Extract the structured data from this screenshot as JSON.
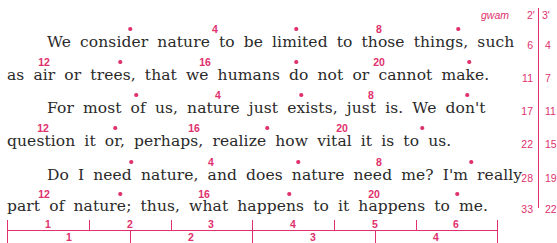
{
  "header": {
    "gwam_label": "gwam",
    "col2_label": "2'",
    "col3_label": "3'"
  },
  "paragraphs": [
    {
      "lines": [
        "We consider nature to be limited to those things, such",
        "as air or trees, that we humans do not or cannot make."
      ]
    },
    {
      "lines": [
        "For most of us, nature just exists, just is. We don't",
        "question it or, perhaps, realize how vital it is to us."
      ]
    },
    {
      "lines": [
        "Do I need nature, and does nature need me? I'm really",
        "part of nature; thus, what happens to it happens to me."
      ]
    }
  ],
  "lines": [
    {
      "text": "We consider nature to be limited to those things, such",
      "gwam2": "6",
      "gwam3": "4"
    },
    {
      "text": "as air or trees, that we humans do not or cannot make.",
      "gwam2": "11",
      "gwam3": "7"
    },
    {
      "text": "For most of us, nature just exists, just is. We don't",
      "gwam2": "17",
      "gwam3": "11"
    },
    {
      "text": "question it or, perhaps, realize how vital it is to us.",
      "gwam2": "22",
      "gwam3": "15"
    },
    {
      "text": "Do I need nature, and does nature need me? I'm really",
      "gwam2": "28",
      "gwam3": "19"
    },
    {
      "text": "part of nature; thus, what happens to it happens to me.",
      "gwam2": "33",
      "gwam3": "22"
    }
  ],
  "markers": {
    "first_line": [
      "•",
      "4",
      "•",
      "8",
      "•"
    ],
    "second_line": [
      "12",
      "•",
      "16",
      "•",
      "20",
      "•"
    ]
  },
  "ruler": {
    "top_labels": [
      "1",
      "2",
      "3",
      "4",
      "5",
      "6"
    ],
    "bottom_labels": [
      "1",
      "2",
      "3",
      "4"
    ]
  }
}
